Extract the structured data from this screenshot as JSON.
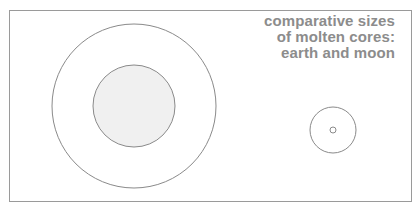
{
  "title": {
    "lines": [
      "comparative sizes",
      "of molten cores:",
      "earth and moon"
    ]
  },
  "colors": {
    "text": "#8c8c8c",
    "stroke": "#8a8a8a",
    "earth_core_fill": "#f0f0f0",
    "frame": "#9a9a9a"
  },
  "bodies": [
    {
      "name": "earth",
      "cx": 134,
      "cy": 106,
      "radius": 82,
      "core_radius": 41
    },
    {
      "name": "moon",
      "cx": 333,
      "cy": 130,
      "radius": 23,
      "core_radius": 3
    }
  ]
}
